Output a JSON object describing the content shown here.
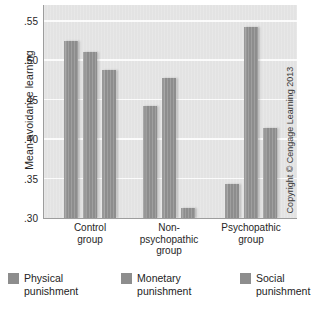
{
  "chart_data": {
    "type": "bar",
    "title": "",
    "xlabel": "",
    "ylabel": "Mean avoidance learning",
    "ylim": [
      0.3,
      0.57
    ],
    "yticks": [
      0.3,
      0.35,
      0.4,
      0.45,
      0.5,
      0.55
    ],
    "ytick_labels": [
      ".30",
      ".35",
      ".40",
      ".45",
      ".50",
      ".55"
    ],
    "grid": true,
    "legend_position": "bottom",
    "categories": [
      "Control group",
      "Non-psychopathic group",
      "Psychopathic group"
    ],
    "category_lines": [
      [
        "Control",
        "group"
      ],
      [
        "Non-",
        "psychopathic",
        "group"
      ],
      [
        "Psychopathic",
        "group"
      ]
    ],
    "series": [
      {
        "name": "Physical punishment",
        "values": [
          0.524,
          0.442,
          0.343
        ]
      },
      {
        "name": "Monetary punishment",
        "values": [
          0.511,
          0.477,
          0.542
        ]
      },
      {
        "name": "Social punishment",
        "values": [
          0.488,
          0.313,
          0.414
        ]
      }
    ],
    "legend": [
      {
        "label_line1": "Physical",
        "label_line2": "punishment",
        "color": "#8d8d8d"
      },
      {
        "label_line1": "Monetary",
        "label_line2": "punishment",
        "color": "#8d8d8d"
      },
      {
        "label_line1": "Social",
        "label_line2": "punishment",
        "color": "#8d8d8d"
      }
    ],
    "colors": {
      "bar": "#8d8d8d",
      "plot_background": "#e3e3e3",
      "gridline": "#fbfbfb",
      "axis": "#9d9d9d",
      "text": "#262626"
    }
  },
  "credit": {
    "text": "Copyright © Cengage Learning 2013"
  }
}
